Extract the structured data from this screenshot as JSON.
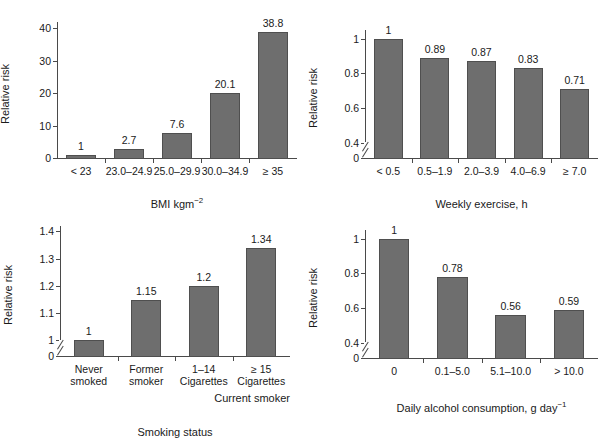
{
  "figure": {
    "background": "#ffffff",
    "bar_color": "#6e6e6e",
    "bar_edge_color": "#4f4f4f",
    "axis_color": "#4a4a4a",
    "text_color": "#1a1a1a"
  },
  "chart_data": [
    {
      "id": "bmi",
      "position": "top-left",
      "type": "bar",
      "title": "",
      "xlabel": "BMI kgm",
      "xlabel_sup": "−2",
      "ylabel": "Relative risk",
      "categories": [
        "< 23",
        "23.0–24.9",
        "25.0–29.9",
        "30.0–34.9",
        "≥ 35"
      ],
      "values": [
        1,
        2.7,
        7.6,
        20.1,
        38.8
      ],
      "value_labels": [
        "1",
        "2.7",
        "7.6",
        "20.1",
        "38.8"
      ],
      "ylim": [
        0,
        42
      ],
      "yticks": [
        0,
        10,
        20,
        30,
        40
      ],
      "ytick_labels": [
        "0",
        "10",
        "20",
        "30",
        "40"
      ],
      "axis_break": false,
      "grid": false,
      "legend": "none"
    },
    {
      "id": "exercise",
      "position": "top-right",
      "type": "bar",
      "title": "",
      "xlabel": "Weekly exercise, h",
      "xlabel_sup": "",
      "ylabel": "Relative risk",
      "categories": [
        "< 0.5",
        "0.5–1.9",
        "2.0–3.9",
        "4.0–6.9",
        "≥ 7.0"
      ],
      "values": [
        1,
        0.89,
        0.87,
        0.83,
        0.71
      ],
      "value_labels": [
        "1",
        "0.89",
        "0.87",
        "0.83",
        "0.71"
      ],
      "ylim": [
        0,
        1.05
      ],
      "yticks": [
        0,
        0.4,
        0.6,
        0.8,
        1
      ],
      "ytick_labels": [
        "0",
        "0.4",
        "0.6",
        "0.8",
        "1"
      ],
      "axis_break": true,
      "axis_break_between": [
        0,
        0.4
      ],
      "grid": false,
      "legend": "none"
    },
    {
      "id": "smoking",
      "position": "bottom-left",
      "type": "bar",
      "title": "",
      "xlabel": "Smoking status",
      "xlabel_sup": "",
      "ylabel": "Relative risk",
      "categories": [
        "Never\nsmoked",
        "Former\nsmoker",
        "1–14\nCigarettes",
        "≥ 15\nCigarettes"
      ],
      "category_lines": [
        [
          "Never",
          "smoked"
        ],
        [
          "Former",
          "smoker"
        ],
        [
          "1–14",
          "Cigarettes"
        ],
        [
          "≥ 15",
          "Cigarettes"
        ]
      ],
      "group_annotation": "Current smoker",
      "values": [
        1,
        1.15,
        1.2,
        1.34
      ],
      "value_labels": [
        "1",
        "1.15",
        "1.2",
        "1.34"
      ],
      "ylim": [
        0,
        1.42
      ],
      "yticks": [
        0,
        1,
        1.1,
        1.2,
        1.3,
        1.4
      ],
      "ytick_labels": [
        "0",
        "1",
        "1.1",
        "1.2",
        "1.3",
        "1.4"
      ],
      "axis_break": true,
      "axis_break_between": [
        0,
        1
      ],
      "grid": false,
      "legend": "none"
    },
    {
      "id": "alcohol",
      "position": "bottom-right",
      "type": "bar",
      "title": "",
      "xlabel": "Daily alcohol consumption, g day",
      "xlabel_sup": "−1",
      "ylabel": "Relative risk",
      "categories": [
        "0",
        "0.1–5.0",
        "5.1–10.0",
        "> 10.0"
      ],
      "values": [
        1,
        0.78,
        0.56,
        0.59
      ],
      "value_labels": [
        "1",
        "0.78",
        "0.56",
        "0.59"
      ],
      "ylim": [
        0,
        1.05
      ],
      "yticks": [
        0,
        0.4,
        0.6,
        0.8,
        1
      ],
      "ytick_labels": [
        "0",
        "0.4",
        "0.6",
        "0.8",
        "1"
      ],
      "axis_break": true,
      "axis_break_between": [
        0,
        0.4
      ],
      "grid": false,
      "legend": "none"
    }
  ]
}
